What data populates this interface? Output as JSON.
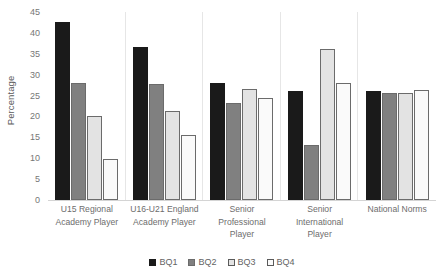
{
  "chart_data": {
    "type": "bar",
    "title": "",
    "xlabel": "",
    "ylabel": "Percentage",
    "ylim": [
      0,
      45
    ],
    "yticks": [
      0,
      5,
      10,
      15,
      20,
      25,
      30,
      35,
      40,
      45
    ],
    "grid": false,
    "legend_position": "bottom-center",
    "categories": [
      "U15 Regional Academy Player",
      "U16-U21 England Academy Player",
      "Senior Professional Player",
      "Senior International Player",
      "National Norms"
    ],
    "series": [
      {
        "name": "BQ1",
        "color": "#1a1a1a",
        "values": [
          42.5,
          36.7,
          28.0,
          26.0,
          26.2
        ]
      },
      {
        "name": "BQ2",
        "color": "#808080",
        "values": [
          28.0,
          27.7,
          23.3,
          13.1,
          25.5
        ]
      },
      {
        "name": "BQ3",
        "color": "#e3e3e3",
        "values": [
          20.1,
          21.3,
          26.5,
          36.2,
          25.6
        ]
      },
      {
        "name": "BQ4",
        "color": "#fafafa",
        "values": [
          9.7,
          15.5,
          24.5,
          27.9,
          26.4
        ]
      }
    ]
  },
  "axis": {
    "y_title": "Percentage",
    "y_tick_labels": [
      "45",
      "40",
      "35",
      "30",
      "25",
      "20",
      "15",
      "10",
      "5",
      "0"
    ]
  },
  "legend": {
    "items": [
      {
        "label": "BQ1"
      },
      {
        "label": "BQ2"
      },
      {
        "label": "BQ3"
      },
      {
        "label": "BQ4"
      }
    ]
  },
  "categories_display": [
    "U15 Regional Academy Player",
    "U16-U21 England Academy Player",
    "Senior Professional Player",
    "Senior International Player",
    "National Norms"
  ]
}
